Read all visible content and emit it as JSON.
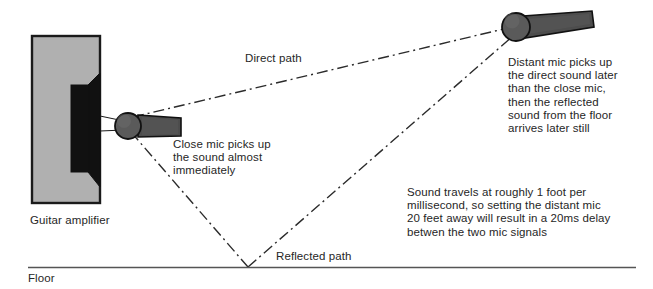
{
  "diagram": {
    "colors": {
      "cabinet_fill": "#b0b0b0",
      "cabinet_stroke": "#1a1a1a",
      "speaker_fill": "#111111",
      "mic_body": "#4d4d4d",
      "mic_head": "#5a5a5a",
      "mic_stroke": "#111111",
      "path_line": "#2b2b2b",
      "floor_line": "#555555",
      "text": "#262626",
      "background": "#ffffff"
    },
    "labels": {
      "direct_path": "Direct path",
      "reflected_path": "Reflected path",
      "floor": "Floor",
      "guitar_amplifier": "Guitar amplifier"
    },
    "notes": {
      "close_mic": "Close mic picks up\nthe sound almost\nimmediately",
      "distant_mic": "Distant mic picks up\nthe direct sound later\nthan the close mic,\nthen the reflected\nsound from the floor\narrives later still",
      "sound_travels": "Sound travels at roughly 1 foot per\nmillisecond, so setting the distant mic\n20 feet away will result in a 20ms delay\nbetwen the two mic signals"
    },
    "objects": {
      "amplifier_name": "guitar-amplifier-cabinet",
      "close_mic_name": "close-microphone",
      "distant_mic_name": "distant-microphone",
      "floor_name": "floor-line"
    }
  }
}
